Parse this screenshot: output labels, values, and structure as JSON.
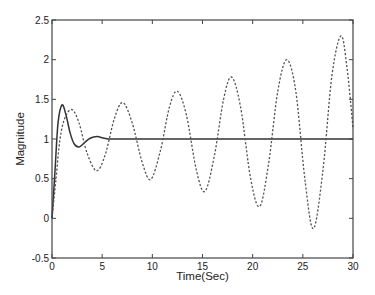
{
  "chart_data": {
    "type": "line",
    "title": "",
    "xlabel": "Time(Sec)",
    "ylabel": "Magnitude",
    "xlim": [
      0,
      30
    ],
    "ylim": [
      -0.5,
      2.5
    ],
    "xticks": [
      0,
      5,
      10,
      15,
      20,
      25,
      30
    ],
    "xtick_labels": [
      "0",
      "5",
      "10",
      "15",
      "20",
      "25",
      "30"
    ],
    "yticks": [
      -0.5,
      0,
      0.5,
      1,
      1.5,
      2,
      2.5
    ],
    "ytick_labels": [
      "-0.5",
      "0",
      "0.5",
      "1",
      "1.5",
      "2",
      "2.5"
    ],
    "grid": false,
    "legend": null,
    "series": [
      {
        "name": "solid",
        "style": "solid",
        "color": "#333333",
        "points": [
          [
            0,
            0
          ],
          [
            0.3,
            0.6
          ],
          [
            0.6,
            1.2
          ],
          [
            1.0,
            1.43
          ],
          [
            1.4,
            1.3
          ],
          [
            1.8,
            1.08
          ],
          [
            2.2,
            0.94
          ],
          [
            2.7,
            0.9
          ],
          [
            3.2,
            0.95
          ],
          [
            3.8,
            1.01
          ],
          [
            4.5,
            1.03
          ],
          [
            5.2,
            1.01
          ],
          [
            6,
            1.0
          ],
          [
            8,
            1.0
          ],
          [
            10,
            1.0
          ],
          [
            15,
            1.0
          ],
          [
            20,
            1.0
          ],
          [
            25,
            1.0
          ],
          [
            30,
            1.0
          ]
        ]
      },
      {
        "name": "dashed",
        "style": "dashed",
        "color": "#555555",
        "points": [
          [
            0,
            0
          ],
          [
            0.4,
            0.5
          ],
          [
            0.8,
            1.0
          ],
          [
            1.3,
            1.27
          ],
          [
            2.0,
            1.37
          ],
          [
            2.7,
            1.2
          ],
          [
            3.5,
            0.82
          ],
          [
            4.45,
            0.6
          ],
          [
            5.3,
            0.8
          ],
          [
            6.2,
            1.25
          ],
          [
            7.05,
            1.46
          ],
          [
            8.0,
            1.2
          ],
          [
            9.0,
            0.7
          ],
          [
            9.84,
            0.49
          ],
          [
            10.8,
            0.85
          ],
          [
            11.7,
            1.4
          ],
          [
            12.5,
            1.6
          ],
          [
            13.4,
            1.3
          ],
          [
            14.4,
            0.6
          ],
          [
            15.25,
            0.34
          ],
          [
            16.2,
            0.8
          ],
          [
            17.1,
            1.5
          ],
          [
            17.9,
            1.78
          ],
          [
            18.8,
            1.4
          ],
          [
            19.8,
            0.5
          ],
          [
            20.7,
            0.15
          ],
          [
            21.6,
            0.7
          ],
          [
            22.5,
            1.6
          ],
          [
            23.4,
            2.0
          ],
          [
            24.3,
            1.6
          ],
          [
            25.2,
            0.5
          ],
          [
            26.05,
            -0.13
          ],
          [
            27.0,
            0.6
          ],
          [
            27.9,
            1.8
          ],
          [
            28.8,
            2.3
          ],
          [
            29.4,
            1.9
          ],
          [
            30,
            1.14
          ]
        ]
      }
    ]
  }
}
